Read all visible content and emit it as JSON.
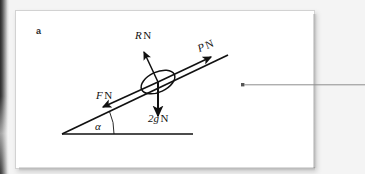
{
  "figure": {
    "part_label": "a",
    "caption_marker_present": true,
    "diagram_type": "free-body force diagram on an inclined plane",
    "labels": {
      "normal_reaction": {
        "symbol": "R",
        "unit": "N",
        "text": "R N"
      },
      "applied_force": {
        "symbol": "P",
        "unit": "N",
        "text": "P N"
      },
      "friction_force": {
        "symbol": "F",
        "unit": "N",
        "text": "F N"
      },
      "weight": {
        "symbol": "2g",
        "unit": "N",
        "text": "2g N"
      },
      "incline_angle": {
        "symbol": "α",
        "text": "α"
      }
    },
    "geometry": {
      "incline_start": [
        47,
        124
      ],
      "incline_end": [
        213,
        45
      ],
      "baseline_start": [
        47,
        124
      ],
      "baseline_end": [
        178,
        124
      ],
      "particle_center": [
        143,
        72
      ],
      "particle_rx": 18,
      "particle_ry": 10,
      "particle_rotation_deg": -25,
      "angle_arc_radius": 52
    },
    "vectors": [
      {
        "name": "normal-reaction-arrow",
        "label": "R N",
        "from": [
          143,
          72
        ],
        "to": [
          128,
          40
        ],
        "direction": "perpendicular to incline, up-left"
      },
      {
        "name": "applied-force-arrow",
        "label": "P N",
        "from": [
          143,
          72
        ],
        "to": [
          198,
          47
        ],
        "direction": "up the incline"
      },
      {
        "name": "friction-force-arrow",
        "label": "F N",
        "from": [
          143,
          72
        ],
        "to": [
          86,
          96
        ],
        "direction": "down the incline"
      },
      {
        "name": "weight-arrow",
        "label": "2g N",
        "from": [
          143,
          72
        ],
        "to": [
          143,
          108
        ],
        "direction": "vertically downward"
      }
    ],
    "colors": {
      "ink": "#111111",
      "panel_background": "#ffffff",
      "page_background": "#f4f4f4",
      "panel_border": "#d2d2d2",
      "gutter": "#2b2b2b",
      "rule_line": "#8d8d8d"
    }
  },
  "margin_rule": {
    "name": "margin-rule-line",
    "bullet": "■",
    "bullet_position": [
      242,
      85
    ],
    "line_from": [
      244,
      85
    ],
    "line_to": [
      365,
      85
    ]
  }
}
